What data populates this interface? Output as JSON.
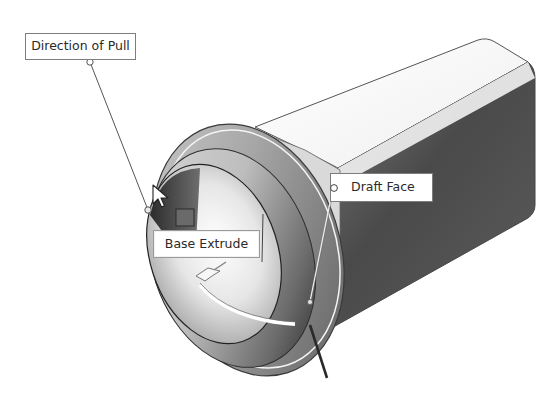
{
  "figure": {
    "callouts": {
      "direction_of_pull": {
        "label": "Direction of Pull"
      },
      "draft_face": {
        "label": "Draft Face"
      },
      "base_extrude": {
        "label": "Base Extrude"
      }
    },
    "icons": {
      "cursor": "mouse-pointer-icon",
      "pull_arrow": "direction-arrow-icon",
      "anchor": "callout-anchor-icon"
    },
    "colors": {
      "background": "#ffffff",
      "callout_border": "#7d7d7d",
      "callout_text": "#2a2a2a",
      "model_dark": "#3c3c3c",
      "model_mid": "#8e8e8e",
      "model_light": "#e8e8e8"
    }
  }
}
